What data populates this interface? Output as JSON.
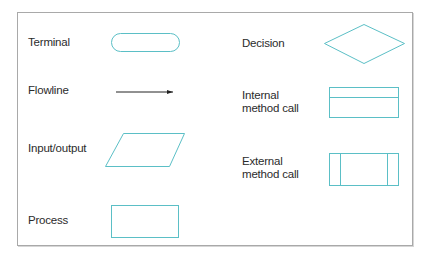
{
  "diagram": {
    "colors": {
      "shape_stroke": "#5bbfc6",
      "flowline": "#222222",
      "frame": "#a9a9a9",
      "text": "#2b2b2b"
    },
    "symbols": [
      {
        "id": "terminal",
        "label": "Terminal",
        "shape": "rounded-rectangle"
      },
      {
        "id": "flowline",
        "label": "Flowline",
        "shape": "arrow"
      },
      {
        "id": "input_output",
        "label": "Input/output",
        "shape": "parallelogram"
      },
      {
        "id": "process",
        "label": "Process",
        "shape": "rectangle"
      },
      {
        "id": "decision",
        "label": "Decision",
        "shape": "diamond"
      },
      {
        "id": "internal_method_call",
        "label_line1": "Internal",
        "label_line2": "method call",
        "shape": "rectangle-with-top-band"
      },
      {
        "id": "external_method_call",
        "label_line1": "External",
        "label_line2": "method call",
        "shape": "rectangle-with-side-bars"
      }
    ]
  }
}
